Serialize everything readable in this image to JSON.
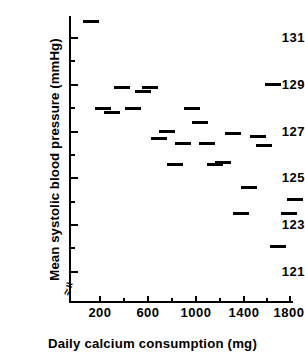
{
  "chart_data": {
    "type": "scatter",
    "marker": "horizontal-dash",
    "title": "",
    "xlabel": "Daily calcium consumption (mg)",
    "ylabel": "Mean systolic blood pressure (mmHg)",
    "xlim": [
      60,
      1900
    ],
    "ylim": [
      120.2,
      131.9
    ],
    "grid": false,
    "legend": null,
    "axis_break": {
      "x": true,
      "y": true
    },
    "xticks": [
      200,
      600,
      1000,
      1400,
      1800
    ],
    "xtick_labels": [
      "200",
      "600",
      "1000",
      "1400",
      "1800"
    ],
    "xminor_ticks": [
      400,
      800,
      1200,
      1600
    ],
    "yticks": [
      121,
      123,
      125,
      127,
      129,
      131
    ],
    "ytick_labels": [
      "121",
      "123",
      "125",
      "127",
      "129",
      "131"
    ],
    "yminor_ticks": [
      122,
      124,
      126,
      128,
      130,
      132
    ],
    "x": [
      120,
      220,
      300,
      370,
      480,
      560,
      640,
      700,
      760,
      830,
      900,
      960,
      1020,
      1080,
      1140,
      1230,
      1300,
      1380,
      1450,
      1530,
      1600,
      1680,
      1780,
      1850
    ],
    "y": [
      131.7,
      128.0,
      127.8,
      128.9,
      128.0,
      128.7,
      128.9,
      126.7,
      127.0,
      125.6,
      126.5,
      128.0,
      127.4,
      126.5,
      125.6,
      125.7,
      126.9,
      123.5,
      124.6,
      126.8,
      126.4,
      129.0,
      122.1,
      123.5,
      124.1
    ],
    "points": [
      {
        "x": 120,
        "y": 131.7
      },
      {
        "x": 225,
        "y": 128.0
      },
      {
        "x": 300,
        "y": 127.8
      },
      {
        "x": 385,
        "y": 128.9
      },
      {
        "x": 480,
        "y": 128.0
      },
      {
        "x": 565,
        "y": 128.7
      },
      {
        "x": 625,
        "y": 128.9
      },
      {
        "x": 700,
        "y": 126.7
      },
      {
        "x": 760,
        "y": 127.0
      },
      {
        "x": 830,
        "y": 125.6
      },
      {
        "x": 900,
        "y": 126.5
      },
      {
        "x": 975,
        "y": 128.0
      },
      {
        "x": 1040,
        "y": 127.4
      },
      {
        "x": 1105,
        "y": 126.5
      },
      {
        "x": 1165,
        "y": 125.6
      },
      {
        "x": 1235,
        "y": 125.7
      },
      {
        "x": 1320,
        "y": 126.9
      },
      {
        "x": 1390,
        "y": 123.5
      },
      {
        "x": 1455,
        "y": 124.6
      },
      {
        "x": 1530,
        "y": 126.8
      },
      {
        "x": 1580,
        "y": 126.4
      },
      {
        "x": 1655,
        "y": 129.0
      },
      {
        "x": 1700,
        "y": 122.1
      },
      {
        "x": 1790,
        "y": 123.5
      },
      {
        "x": 1845,
        "y": 124.1
      }
    ],
    "n_points": 25,
    "trend": "negative"
  },
  "axes": {
    "y_break_glyph": "≈",
    "x_break_glyph": "≈"
  }
}
